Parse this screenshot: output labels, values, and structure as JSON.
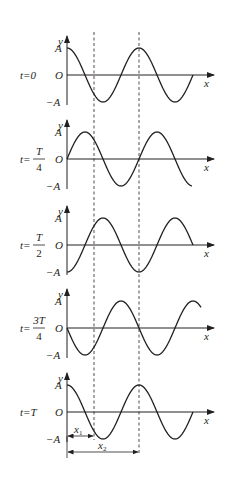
{
  "figure": {
    "axis_labels": {
      "y": "y",
      "x": "x",
      "origin": "O",
      "amplitude_pos": "A",
      "amplitude_neg": "−A"
    },
    "panels": [
      {
        "time_label": "t=0",
        "time_prefix": "t=",
        "numerator": "",
        "denominator": "",
        "plain": "0",
        "phase_shift_px": 0,
        "axis_y": 75,
        "end_x": 193
      },
      {
        "time_label": "t=T/4",
        "time_prefix": "t=",
        "numerator": "T",
        "denominator": "4",
        "plain": "",
        "phase_shift_px": 18,
        "axis_y": 159,
        "end_x": 192
      },
      {
        "time_label": "t=T/2",
        "time_prefix": "t=",
        "numerator": "T",
        "denominator": "2",
        "plain": "",
        "phase_shift_px": 36,
        "axis_y": 245,
        "end_x": 193
      },
      {
        "time_label": "t=3T/4",
        "time_prefix": "t=",
        "numerator": "3T",
        "denominator": "4",
        "plain": "",
        "phase_shift_px": 54,
        "axis_y": 328,
        "end_x": 201
      },
      {
        "time_label": "t=T",
        "time_prefix": "t=",
        "numerator": "",
        "denominator": "",
        "plain": "T",
        "phase_shift_px": 0,
        "axis_y": 412,
        "end_x": 193
      }
    ],
    "reference_lines": [
      {
        "name": "x1",
        "x_px": 94
      },
      {
        "name": "x2",
        "x_px": 139
      }
    ],
    "dimensions": [
      {
        "label": "x₁",
        "base": "x",
        "sub": "1"
      },
      {
        "label": "x₂",
        "base": "x",
        "sub": "2"
      }
    ],
    "wave": {
      "wavelength_px": 72,
      "amplitude_px": 27,
      "origin_x_px": 67,
      "color": "#231f20"
    }
  }
}
